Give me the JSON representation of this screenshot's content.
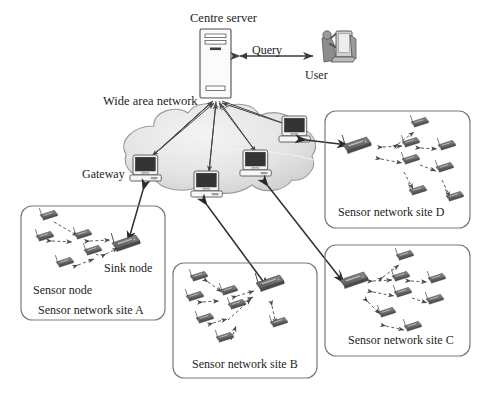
{
  "diagram": {
    "title_label": "Centre server",
    "user_label": "User",
    "query_label": "Query",
    "wan_label": "Wide area network",
    "gateway_label": "Gateway",
    "sink_node_label": "Sink node",
    "sensor_node_label": "Sensor node",
    "sites": [
      {
        "id": "A",
        "label": "Sensor network site A"
      },
      {
        "id": "B",
        "label": "Sensor network site B"
      },
      {
        "id": "C",
        "label": "Sensor network site C"
      },
      {
        "id": "D",
        "label": "Sensor network site D"
      }
    ],
    "colors": {
      "ink": "#1d1d1d",
      "line": "#4a4a4a",
      "node_fill": "#6e6e6e",
      "node_stroke": "#3c3c3c",
      "cloud_fill": "#e2e2e2",
      "cloud_stroke": "#8f8f8f",
      "box_stroke": "#7a7a7a",
      "screen_fill": "#3a3a3a",
      "server_fill": "#fbfbfb"
    },
    "counts": {
      "gateways": 4,
      "sites": 4
    }
  }
}
